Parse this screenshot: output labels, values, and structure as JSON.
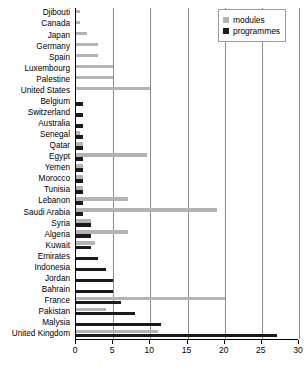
{
  "chart_data": {
    "type": "bar",
    "orientation": "horizontal",
    "title": "",
    "subtitle": "",
    "xlabel": "",
    "ylabel": "",
    "xlim": [
      0,
      30
    ],
    "xticks": [
      0,
      5,
      10,
      15,
      20,
      25,
      30
    ],
    "grid": "vertical",
    "legend_position": "top-right",
    "categories": [
      "Djibouti",
      "Canada",
      "Japan",
      "Germany",
      "Spain",
      "Luxembourg",
      "Palestine",
      "United States",
      "Belgium",
      "Switzerland",
      "Australia",
      "Senegal",
      "Qatar",
      "Egypt",
      "Yemen",
      "Morocco",
      "Tunisia",
      "Lebanon",
      "Saudi Arabia",
      "Syria",
      "Algeria",
      "Kuwait",
      "Emirates",
      "Indonesia",
      "Jordan",
      "Bahrain",
      "France",
      "Pakistan",
      "Malysia",
      "United Kingdom"
    ],
    "series": [
      {
        "name": "modules",
        "color": "#b3b3b3",
        "values": [
          0.5,
          0.5,
          1.5,
          3,
          3,
          5,
          5,
          10,
          0,
          0,
          0,
          0.5,
          1,
          9.5,
          1,
          1,
          1,
          7,
          19,
          2,
          7,
          2.5,
          0,
          0,
          0,
          0,
          20,
          4,
          0,
          11
        ]
      },
      {
        "name": "programmes",
        "color": "#1a1a1a",
        "values": [
          0,
          0,
          0,
          0,
          0,
          0,
          0,
          0,
          1,
          1,
          1,
          1,
          1,
          1,
          1,
          1,
          1,
          1,
          1,
          2,
          2,
          2,
          3,
          4,
          5,
          5,
          6,
          8,
          11.5,
          27
        ]
      }
    ]
  },
  "legend": {
    "items": [
      {
        "label": "modules",
        "color": "#b3b3b3"
      },
      {
        "label": "programmes",
        "color": "#1a1a1a"
      }
    ]
  }
}
